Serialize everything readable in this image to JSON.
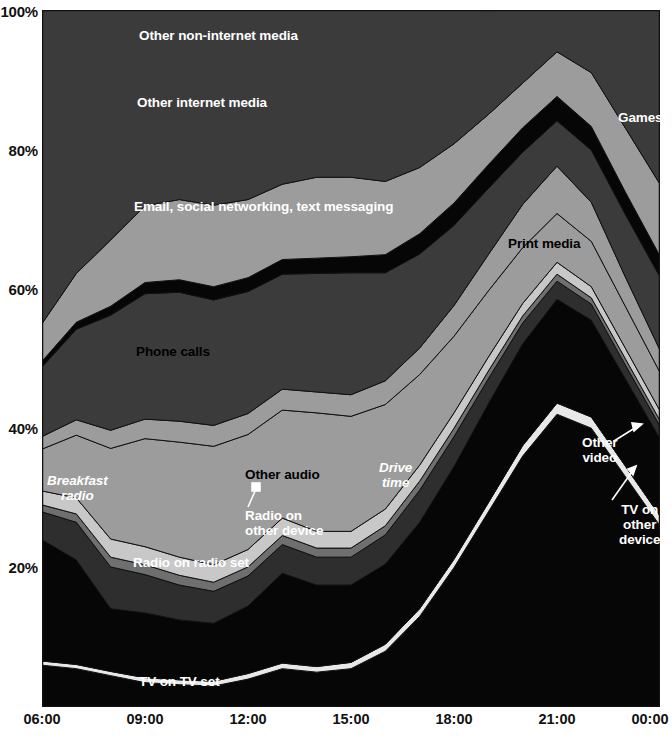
{
  "axes": {
    "y_ticks": [
      "100%",
      "80%",
      "60%",
      "40%",
      "20%"
    ],
    "y_values": [
      100,
      80,
      60,
      40,
      20
    ],
    "x_ticks": [
      "06:00",
      "09:00",
      "12:00",
      "15:00",
      "18:00",
      "21:00",
      "00:00"
    ],
    "x_values": [
      6,
      9,
      12,
      15,
      18,
      21,
      24
    ]
  },
  "labels": {
    "other_non_internet_media": "Other non-internet media",
    "other_internet_media": "Other internet media",
    "games": "Games",
    "email_social_text": "Email, social networking, text messaging",
    "print_media": "Print media",
    "phone_calls": "Phone calls",
    "other_audio": "Other audio",
    "radio_on_other_device": "Radio on\nother device",
    "radio_on_radio_set": "Radio on radio set",
    "breakfast_radio": "Breakfast\nradio",
    "drive_time": "Drive\ntime",
    "other_video": "Other\nvideo",
    "tv_on_other_device": "TV on\nother\ndevice",
    "tv_on_tv_set": "TV on TV set"
  },
  "colors": {
    "black": "#060606",
    "dark_gray": "#3b3b3b",
    "mid_gray": "#565656",
    "gray": "#6f6f6f",
    "light_gray": "#9c9c9c",
    "pale_gray": "#b4b4b4",
    "near_white": "#e8e8e8",
    "white": "#ffffff",
    "stroke": "#111111",
    "background": "#ffffff"
  },
  "chart_data": {
    "type": "area",
    "title": "",
    "xlabel": "",
    "ylabel": "",
    "stacked": true,
    "stack_total": 100,
    "grid": false,
    "legend": "in-place annotations",
    "xlim": [
      6,
      24
    ],
    "ylim": [
      0,
      100
    ],
    "x": [
      6,
      7,
      8,
      9,
      10,
      11,
      12,
      13,
      14,
      15,
      16,
      17,
      18,
      19,
      20,
      21,
      22,
      23,
      24
    ],
    "x_tick_labels": [
      "06:00",
      "09:00",
      "12:00",
      "15:00",
      "18:00",
      "21:00",
      "00:00"
    ],
    "series": [
      {
        "name": "TV on TV set",
        "color": "#060606",
        "label_color": "#ffffff",
        "values": [
          6.0,
          5.5,
          4.5,
          3.5,
          3.2,
          3.0,
          4.0,
          5.5,
          5.0,
          5.5,
          8.0,
          13.0,
          20.0,
          28.0,
          36.0,
          42.0,
          40.0,
          33.0,
          26.0
        ]
      },
      {
        "name": "TV on other device",
        "color": "#e8e8e8",
        "label_color": "#ffffff",
        "values": [
          0.6,
          0.6,
          0.6,
          0.7,
          0.7,
          0.7,
          0.8,
          0.8,
          0.8,
          0.9,
          1.0,
          1.1,
          1.2,
          1.3,
          1.5,
          1.6,
          1.6,
          1.5,
          1.4
        ]
      },
      {
        "name": "Other video",
        "color": "#060606",
        "label_color": "#ffffff",
        "values": [
          17.4,
          15.0,
          9.0,
          9.3,
          8.6,
          8.3,
          9.7,
          12.9,
          11.7,
          11.1,
          11.5,
          12.4,
          13.3,
          14.2,
          14.6,
          14.9,
          13.9,
          12.5,
          11.1
        ]
      },
      {
        "name": "Radio on radio set",
        "color": "#2e2e2e",
        "label_color": "#ffffff",
        "values": [
          4.0,
          5.4,
          6.0,
          5.5,
          5.0,
          4.6,
          4.3,
          4.1,
          4.0,
          4.0,
          4.2,
          4.6,
          4.3,
          3.6,
          3.0,
          2.6,
          2.3,
          2.0,
          1.8
        ]
      },
      {
        "name": "Radio on other device",
        "color": "#6f6f6f",
        "label_color": "#ffffff",
        "values": [
          1.0,
          1.2,
          1.4,
          1.4,
          1.4,
          1.3,
          1.3,
          1.3,
          1.3,
          1.3,
          1.3,
          1.3,
          1.2,
          1.1,
          1.0,
          1.0,
          0.9,
          0.9,
          0.8
        ]
      },
      {
        "name": "Other audio",
        "color": "#c8c8c8",
        "label_color": "#000000",
        "values": [
          2.0,
          2.3,
          2.6,
          2.6,
          2.6,
          2.5,
          2.5,
          2.5,
          2.4,
          2.4,
          2.4,
          2.3,
          2.2,
          2.0,
          1.8,
          1.7,
          1.6,
          1.5,
          1.4
        ]
      },
      {
        "name": "Phone calls",
        "color": "#9c9c9c",
        "label_color": "#000000",
        "values": [
          6.0,
          9.0,
          13.0,
          15.5,
          16.5,
          17.0,
          16.5,
          15.5,
          17.0,
          16.5,
          15.0,
          13.0,
          11.0,
          9.5,
          8.0,
          7.0,
          6.5,
          6.0,
          5.5
        ]
      },
      {
        "name": "Print media",
        "color": "#9c9c9c",
        "label_color": "#000000",
        "values": [
          1.8,
          2.2,
          2.6,
          2.8,
          3.0,
          3.0,
          3.0,
          3.0,
          3.0,
          3.1,
          3.4,
          3.8,
          4.4,
          5.2,
          6.2,
          6.8,
          5.6,
          4.2,
          3.2
        ]
      },
      {
        "name": "Email, social networking, text messaging",
        "color": "#3b3b3b",
        "label_color": "#ffffff",
        "values": [
          10.0,
          13.0,
          16.5,
          18.0,
          18.5,
          18.0,
          17.5,
          16.5,
          17.0,
          17.5,
          15.5,
          13.5,
          11.5,
          9.5,
          7.5,
          6.5,
          7.5,
          9.0,
          10.5
        ]
      },
      {
        "name": "Games",
        "color": "#060606",
        "label_color": "#ffffff",
        "values": [
          0.8,
          1.0,
          1.3,
          1.6,
          1.8,
          1.9,
          2.0,
          2.1,
          2.2,
          2.3,
          2.6,
          2.9,
          3.2,
          3.4,
          3.5,
          3.5,
          3.4,
          3.2,
          3.0
        ]
      },
      {
        "name": "Other internet media",
        "color": "#9c9c9c",
        "label_color": "#ffffff",
        "values": [
          5.4,
          7.0,
          9.5,
          11.0,
          11.5,
          11.7,
          11.2,
          10.8,
          11.6,
          11.4,
          10.5,
          9.5,
          8.5,
          7.2,
          6.4,
          6.4,
          7.7,
          9.2,
          10.3
        ]
      },
      {
        "name": "Other non-internet media",
        "color": "#3b3b3b",
        "label_color": "#ffffff",
        "values": [
          45.0,
          37.8,
          33.0,
          28.1,
          27.2,
          28.0,
          27.2,
          25.0,
          24.0,
          24.0,
          25.2,
          22.6,
          19.2,
          14.9,
          10.5,
          6.1,
          9.0,
          17.0,
          25.0
        ]
      }
    ],
    "annotations": [
      {
        "text": "Breakfast radio",
        "style": "italic",
        "series": "Radio on radio set",
        "x": 7.0
      },
      {
        "text": "Drive time",
        "style": "italic",
        "series": "Radio on radio set",
        "x": 17.0
      },
      {
        "text": "Radio on other device",
        "style": "leader-arrow",
        "series": "Radio on other device",
        "x": 12.3
      },
      {
        "text": "TV on other device",
        "style": "leader-arrow",
        "series": "TV on other device",
        "x": 23.2
      },
      {
        "text": "Other video",
        "style": "leader-arrow",
        "series": "Other video",
        "x": 22.6
      }
    ]
  }
}
